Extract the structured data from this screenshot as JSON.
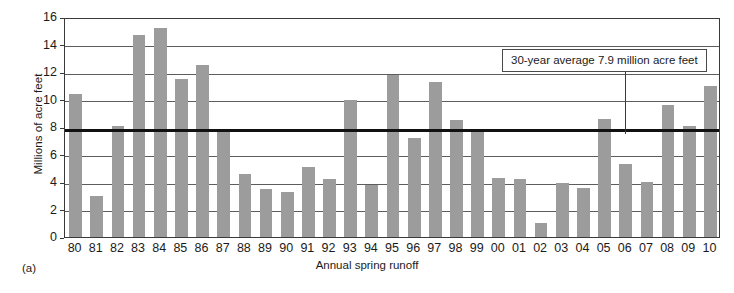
{
  "figure": {
    "panel_caption": "(a)",
    "xlabel": "Annual spring runoff",
    "ylabel": "Millions of acre feet",
    "annotation": "30-year average 7.9 million acre feet",
    "bar_color": "#9c9c9c",
    "gridline_color": "#5d5d5d",
    "average_line_color": "#111111"
  },
  "chart_data": {
    "type": "bar",
    "title": "",
    "xlabel": "Annual spring runoff",
    "ylabel": "Millions of acre feet",
    "ylim": [
      0,
      16
    ],
    "yticks": [
      0,
      2,
      4,
      6,
      8,
      10,
      12,
      14,
      16
    ],
    "grid": true,
    "legend": "none",
    "categories": [
      "80",
      "81",
      "82",
      "83",
      "84",
      "85",
      "86",
      "87",
      "88",
      "89",
      "90",
      "91",
      "92",
      "93",
      "94",
      "95",
      "96",
      "97",
      "98",
      "99",
      "00",
      "01",
      "02",
      "03",
      "04",
      "05",
      "06",
      "07",
      "08",
      "09",
      "10"
    ],
    "values": [
      10.4,
      3.0,
      8.1,
      14.7,
      15.2,
      11.5,
      12.5,
      7.7,
      4.6,
      3.5,
      3.3,
      5.1,
      4.2,
      10.0,
      3.8,
      11.8,
      7.2,
      11.3,
      8.5,
      7.7,
      4.3,
      4.2,
      1.0,
      3.9,
      3.6,
      8.6,
      5.3,
      4.0,
      9.6,
      8.1,
      11.0
    ],
    "reference_line": {
      "label": "30-year average 7.9 million acre feet",
      "value": 7.9
    }
  }
}
